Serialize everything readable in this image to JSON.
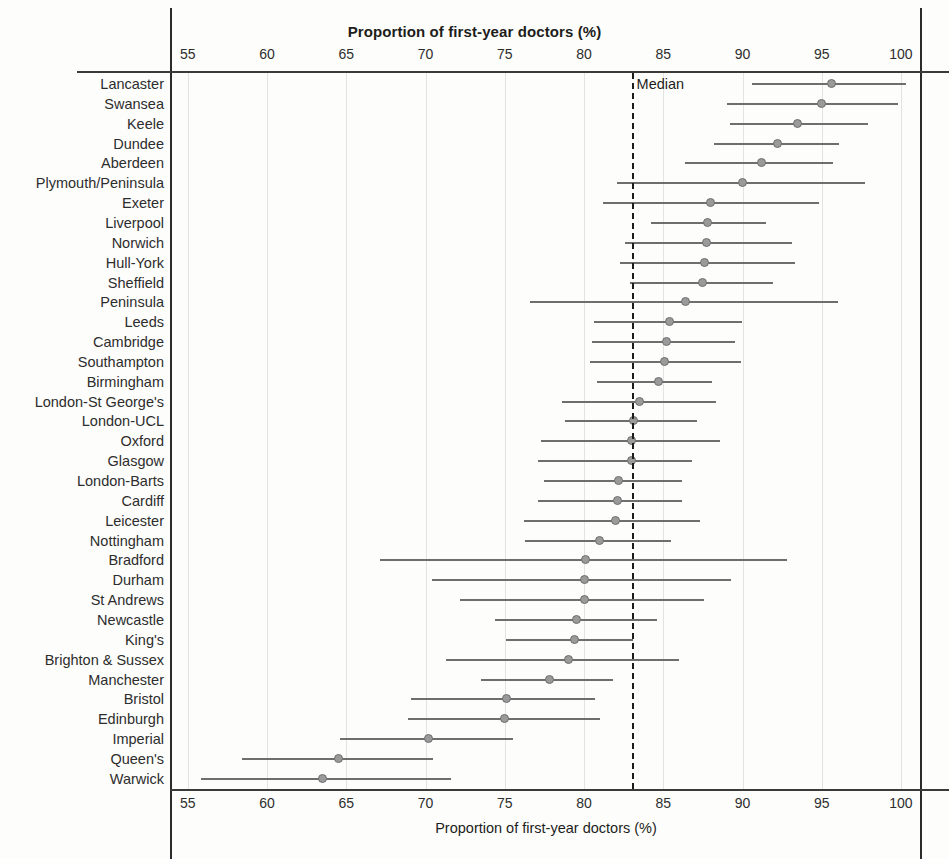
{
  "chart_data": {
    "type": "scatter",
    "title": "Proportion of first-year doctors (%)",
    "xlabel": "Proportion of first-year doctors (%)",
    "ylabel": "",
    "xlim": [
      54.0,
      101.2
    ],
    "xticks": [
      55,
      60,
      65,
      70,
      75,
      80,
      85,
      90,
      95,
      100
    ],
    "grid": true,
    "legend": "none",
    "annotations": [
      {
        "label": "Median",
        "x": 83.0,
        "type": "vertical-dashed-line"
      }
    ],
    "median_value": 83.0,
    "error_bar_type": "confidence-interval",
    "categories": [
      "Lancaster",
      "Swansea",
      "Keele",
      "Dundee",
      "Aberdeen",
      "Plymouth/Peninsula",
      "Exeter",
      "Liverpool",
      "Norwich",
      "Hull-York",
      "Sheffield",
      "Peninsula",
      "Leeds",
      "Cambridge",
      "Southampton",
      "Birmingham",
      "London-St George's",
      "London-UCL",
      "Oxford",
      "Glasgow",
      "London-Barts",
      "Cardiff",
      "Leicester",
      "Nottingham",
      "Bradford",
      "Durham",
      "St Andrews",
      "Newcastle",
      "King's",
      "Brighton & Sussex",
      "Manchester",
      "Bristol",
      "Edinburgh",
      "Imperial",
      "Queen's",
      "Warwick"
    ],
    "values": [
      95.6,
      95.0,
      93.5,
      92.2,
      91.2,
      90.0,
      88.0,
      87.8,
      87.7,
      87.6,
      87.5,
      86.4,
      85.4,
      85.2,
      85.1,
      84.7,
      83.5,
      83.1,
      83.0,
      83.0,
      82.2,
      82.1,
      82.0,
      81.0,
      80.1,
      80.0,
      80.0,
      79.5,
      79.4,
      79.0,
      77.8,
      75.1,
      75.0,
      70.2,
      64.5,
      63.5
    ],
    "ci_low": [
      90.6,
      89.0,
      89.2,
      88.2,
      86.4,
      82.1,
      81.2,
      84.2,
      82.6,
      82.3,
      82.9,
      76.6,
      80.6,
      80.5,
      80.4,
      80.8,
      78.6,
      78.8,
      77.3,
      77.1,
      77.5,
      77.1,
      76.2,
      76.3,
      67.1,
      70.4,
      72.2,
      74.4,
      75.1,
      71.3,
      73.5,
      69.1,
      68.9,
      64.6,
      58.4,
      55.8
    ],
    "ci_high": [
      100.3,
      99.8,
      97.9,
      96.1,
      95.7,
      97.7,
      94.8,
      91.5,
      93.1,
      93.3,
      91.9,
      96.0,
      90.0,
      89.5,
      89.9,
      88.1,
      88.3,
      87.1,
      88.6,
      86.8,
      86.2,
      86.2,
      87.3,
      85.5,
      92.8,
      89.3,
      87.6,
      84.6,
      83.1,
      86.0,
      81.8,
      80.7,
      81.0,
      75.5,
      70.5,
      71.6
    ]
  },
  "colors": {
    "line": "#6e6e6e",
    "dot": "#9a9a9a",
    "grid": "#e3e3e1",
    "axis": "#2b2b2b",
    "text": "#2d2d2d"
  }
}
